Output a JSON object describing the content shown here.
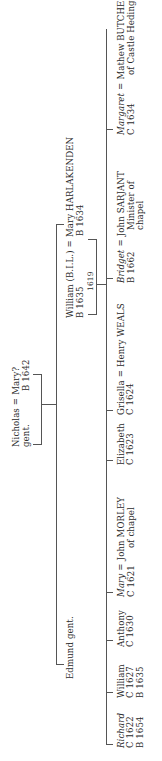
{
  "generation1": {
    "husband": {
      "name": "Nicholas",
      "note": "gent."
    },
    "equals": "=",
    "wife": {
      "name": "Mary?",
      "note": "B 1642"
    }
  },
  "generation2": {
    "edmund": {
      "name": "Edmund gent."
    },
    "william": {
      "name": "William (B.I.L.)",
      "note": "B 1635"
    },
    "equals": "=",
    "wife": {
      "name": "Mary HARLAKENDEN",
      "note": "B 1634"
    },
    "marriage_year": "1619"
  },
  "children": [
    {
      "name": "Richard",
      "italic": true,
      "lines": [
        "C 1622",
        "B 1654"
      ]
    },
    {
      "name": "William",
      "italic": false,
      "lines": [
        "C 1627",
        "B 1635"
      ]
    },
    {
      "name": "Anthony",
      "italic": false,
      "lines": [
        "C 1630"
      ]
    },
    {
      "name": "Mary",
      "italic": true,
      "lines": [
        "C 1621"
      ],
      "spouse": {
        "name": "John MORLEY",
        "lines": [
          "of chapel"
        ]
      }
    },
    {
      "name": "Elizabeth",
      "italic": false,
      "lines": [
        "C 1623"
      ]
    },
    {
      "name": "Grisella",
      "italic": false,
      "lines": [
        "C 1624"
      ],
      "spouse": {
        "name": "Henry WEALS",
        "lines": []
      }
    },
    {
      "name": "Bridget",
      "italic": true,
      "lines": [
        "B 1662"
      ],
      "spouse": {
        "name": "John SARJANT",
        "lines": [
          "Minister of",
          "chapel"
        ]
      }
    },
    {
      "name": "Margaret",
      "italic": true,
      "lines": [
        "C 1634"
      ],
      "spouse": {
        "name": "Mathew BUTCHER",
        "lines": [
          "of Castle Hedingham"
        ]
      }
    }
  ],
  "equals": "="
}
